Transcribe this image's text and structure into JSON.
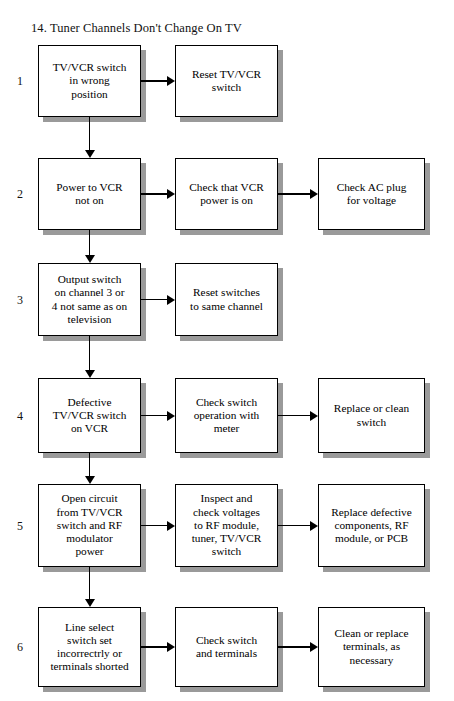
{
  "document": {
    "title": "14. Tuner Channels Don't Change On TV"
  },
  "layout": {
    "columns": {
      "symptom_x": 38,
      "symptom_w": 103,
      "check_x": 175,
      "check_w": 103,
      "remedy_x": 318,
      "remedy_w": 107
    },
    "shadow_color": "#9a9a9a",
    "border_color": "#000000",
    "box_fill": "#ffffff"
  },
  "rows": [
    {
      "number": "1",
      "y": 45,
      "h": 72,
      "symptom": "TV/VCR switch\nin wrong\nposition",
      "check": "Reset TV/VCR\nswitch",
      "remedy": null
    },
    {
      "number": "2",
      "y": 158,
      "h": 72,
      "symptom": "Power to VCR\nnot on",
      "check": "Check that VCR\npower is on",
      "remedy": "Check AC plug\nfor voltage"
    },
    {
      "number": "3",
      "y": 263,
      "h": 73,
      "symptom": "Output switch\non channel 3 or\n4 not same as on\ntelevision",
      "check": "Reset switches\nto same channel",
      "remedy": null
    },
    {
      "number": "4",
      "y": 378,
      "h": 75,
      "symptom": "Defective\nTV/VCR switch\non VCR",
      "check": "Check switch\noperation with\nmeter",
      "remedy": "Replace or clean\nswitch"
    },
    {
      "number": "5",
      "y": 484,
      "h": 83,
      "symptom": "Open circuit\nfrom TV/VCR\nswitch and RF\nmodulator\npower",
      "check": "Inspect and\ncheck voltages\nto RF module,\ntuner, TV/VCR\nswitch",
      "remedy": "Replace defective\ncomponents, RF\nmodule, or PCB"
    },
    {
      "number": "6",
      "y": 607,
      "h": 80,
      "symptom": "Line select\nswitch set\nincorrectrly or\nterminals shorted",
      "check": "Check switch\nand terminals",
      "remedy": "Clean or replace\nterminals, as\nnecessary"
    }
  ]
}
